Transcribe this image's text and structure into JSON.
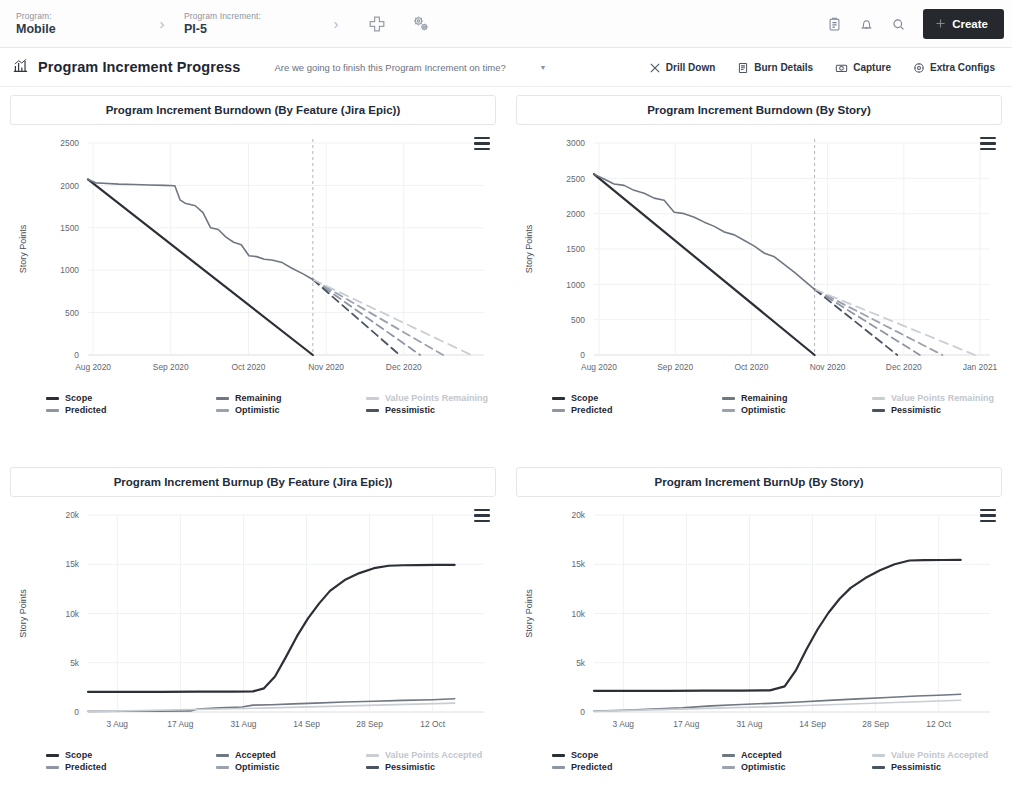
{
  "topbar": {
    "program_label": "Program:",
    "program_value": "Mobile",
    "increment_label": "Program Increment:",
    "increment_value": "PI-5",
    "separator": "›",
    "add_icon": "plus-icon",
    "settings_icon": "gears-icon",
    "clipboard_icon": "clipboard-icon",
    "bell_icon": "bell-icon",
    "search_icon": "search-icon",
    "create_label": "Create",
    "create_bg": "#25282c"
  },
  "subheader": {
    "title": "Program Increment Progress",
    "title_icon": "chart-icon",
    "question": "Are we going to finish this Program Increment on time?",
    "caret_icon": "chevron-down-icon",
    "actions": [
      {
        "label": "Drill Down",
        "icon": "drill-down-icon"
      },
      {
        "label": "Burn Details",
        "icon": "burn-details-icon"
      },
      {
        "label": "Capture",
        "icon": "capture-icon"
      },
      {
        "label": "Extra Configs",
        "icon": "extra-configs-icon"
      }
    ]
  },
  "colors": {
    "scope": "#2b2f36",
    "predicted": "#8f96a3",
    "remaining": "#6f7782",
    "optimistic": "#9aa2ad",
    "value_points": "#c9cdd4",
    "pessimistic": "#4a5360",
    "accepted": "#6f7782",
    "today_line": "#b7bcc5",
    "grid": "#f0f1f3"
  },
  "legends": {
    "burndown": [
      {
        "label": "Scope",
        "color": "#2b2f36"
      },
      {
        "label": "Remaining",
        "color": "#6f7782"
      },
      {
        "label": "Value Points Remaining",
        "color": "#c9cdd4"
      },
      {
        "label": "Predicted",
        "color": "#8f96a3"
      },
      {
        "label": "Optimistic",
        "color": "#9aa2ad"
      },
      {
        "label": "Pessimistic",
        "color": "#4a5360"
      }
    ],
    "burnup": [
      {
        "label": "Scope",
        "color": "#2b2f36"
      },
      {
        "label": "Accepted",
        "color": "#6f7782"
      },
      {
        "label": "Value Points Accepted",
        "color": "#c9cdd4"
      },
      {
        "label": "Predicted",
        "color": "#8f96a3"
      },
      {
        "label": "Optimistic",
        "color": "#9aa2ad"
      },
      {
        "label": "Pessimistic",
        "color": "#4a5360"
      }
    ]
  },
  "chart_data": [
    {
      "id": "burndown-feature",
      "type": "line",
      "title": "Program Increment Burndown (By Feature (Jira Epic))",
      "xlabel": "",
      "ylabel": "Story Points",
      "ylim": [
        0,
        2500
      ],
      "yticks": [
        0,
        500,
        1000,
        1500,
        2000,
        2500
      ],
      "ytick_labels": [
        "0",
        "500",
        "1000",
        "1500",
        "2000",
        "2500"
      ],
      "xticks": [
        "Aug 2020",
        "Sep 2020",
        "Oct 2020",
        "Nov 2020",
        "Dec 2020"
      ],
      "grid": true,
      "legend_position": "bottom",
      "today_marker": "Nov 2020",
      "series": [
        {
          "name": "Scope",
          "style": "solid",
          "x": [
            0,
            88
          ],
          "values": [
            2070,
            0
          ]
        },
        {
          "name": "Remaining",
          "style": "solid",
          "x": [
            0,
            3,
            6,
            12,
            18,
            24,
            30,
            34,
            36,
            38,
            42,
            45,
            48,
            51,
            54,
            57,
            60,
            63,
            66,
            69,
            72,
            76,
            80,
            84,
            88
          ],
          "values": [
            2070,
            2030,
            2025,
            2015,
            2010,
            2005,
            2000,
            1995,
            1830,
            1790,
            1760,
            1680,
            1500,
            1480,
            1390,
            1330,
            1300,
            1170,
            1160,
            1130,
            1120,
            1090,
            1020,
            960,
            890
          ]
        },
        {
          "name": "Predicted",
          "style": "dashed",
          "x": [
            88,
            130
          ],
          "values": [
            890,
            0
          ]
        },
        {
          "name": "Optimistic",
          "style": "dashed",
          "x": [
            88,
            139
          ],
          "values": [
            890,
            0
          ]
        },
        {
          "name": "Pessimistic",
          "style": "dashed",
          "x": [
            88,
            122
          ],
          "values": [
            890,
            0
          ]
        },
        {
          "name": "Value Points Remaining",
          "style": "dashed",
          "x": [
            88,
            150
          ],
          "values": [
            890,
            0
          ]
        }
      ]
    },
    {
      "id": "burndown-story",
      "type": "line",
      "title": "Program Increment Burndown (By Story)",
      "xlabel": "",
      "ylabel": "Story Points",
      "ylim": [
        0,
        3000
      ],
      "yticks": [
        0,
        500,
        1000,
        1500,
        2000,
        2500,
        3000
      ],
      "ytick_labels": [
        "0",
        "500",
        "1000",
        "1500",
        "2000",
        "2500",
        "3000"
      ],
      "xticks": [
        "Aug 2020",
        "Sep 2020",
        "Oct 2020",
        "Nov 2020",
        "Dec 2020",
        "Jan 2021"
      ],
      "grid": true,
      "legend_position": "bottom",
      "today_marker": "Nov 2020",
      "series": [
        {
          "name": "Scope",
          "style": "solid",
          "x": [
            0,
            88
          ],
          "values": [
            2560,
            0
          ]
        },
        {
          "name": "Remaining",
          "style": "solid",
          "x": [
            0,
            4,
            8,
            12,
            16,
            20,
            24,
            28,
            32,
            36,
            40,
            44,
            48,
            52,
            56,
            60,
            64,
            68,
            72,
            76,
            80,
            84,
            88
          ],
          "values": [
            2560,
            2490,
            2420,
            2400,
            2330,
            2290,
            2220,
            2190,
            2020,
            2000,
            1950,
            1880,
            1820,
            1740,
            1700,
            1620,
            1540,
            1440,
            1390,
            1280,
            1170,
            1050,
            930
          ]
        },
        {
          "name": "Predicted",
          "style": "dashed",
          "x": [
            88,
            130
          ],
          "values": [
            930,
            0
          ]
        },
        {
          "name": "Optimistic",
          "style": "dashed",
          "x": [
            88,
            139
          ],
          "values": [
            930,
            0
          ]
        },
        {
          "name": "Pessimistic",
          "style": "dashed",
          "x": [
            88,
            121
          ],
          "values": [
            930,
            0
          ]
        },
        {
          "name": "Value Points Remaining",
          "style": "dashed",
          "x": [
            88,
            152
          ],
          "values": [
            930,
            0
          ]
        }
      ]
    },
    {
      "id": "burnup-feature",
      "type": "line",
      "title": "Program Increment Burnup (By Feature (Jira Epic))",
      "xlabel": "",
      "ylabel": "Story Points",
      "ylim": [
        0,
        20000
      ],
      "yticks": [
        0,
        5000,
        10000,
        15000,
        20000
      ],
      "ytick_labels": [
        "0",
        "5k",
        "10k",
        "15k",
        "20k"
      ],
      "xticks": [
        "3 Aug",
        "17 Aug",
        "31 Aug",
        "14 Sep",
        "28 Sep",
        "12 Oct"
      ],
      "grid": true,
      "legend_position": "bottom",
      "series": [
        {
          "name": "Scope",
          "style": "solid",
          "x": [
            0,
            10,
            20,
            30,
            40,
            45,
            48,
            51,
            54,
            57,
            60,
            63,
            66,
            70,
            74,
            78,
            82,
            86,
            90,
            95,
            100
          ],
          "values": [
            2050,
            2050,
            2050,
            2060,
            2070,
            2100,
            2400,
            3600,
            5600,
            7700,
            9500,
            11000,
            12300,
            13400,
            14100,
            14600,
            14850,
            14900,
            14920,
            14930,
            14940
          ]
        },
        {
          "name": "Accepted",
          "style": "solid",
          "x": [
            0,
            10,
            20,
            28,
            30,
            36,
            42,
            45,
            50,
            56,
            62,
            70,
            78,
            86,
            94,
            100
          ],
          "values": [
            60,
            70,
            90,
            110,
            300,
            420,
            500,
            700,
            740,
            820,
            900,
            1010,
            1090,
            1180,
            1250,
            1340
          ]
        },
        {
          "name": "Value Points Accepted",
          "style": "solid",
          "x": [
            0,
            50,
            100
          ],
          "values": [
            40,
            420,
            900
          ]
        }
      ]
    },
    {
      "id": "burnup-story",
      "type": "line",
      "title": "Program Increment BurnUp (By Story)",
      "xlabel": "",
      "ylabel": "Story Points",
      "ylim": [
        0,
        20000
      ],
      "yticks": [
        0,
        5000,
        10000,
        15000,
        20000
      ],
      "ytick_labels": [
        "0",
        "5k",
        "10k",
        "15k",
        "20k"
      ],
      "xticks": [
        "3 Aug",
        "17 Aug",
        "31 Aug",
        "14 Sep",
        "28 Sep",
        "12 Oct"
      ],
      "grid": true,
      "legend_position": "bottom",
      "series": [
        {
          "name": "Scope",
          "style": "solid",
          "x": [
            0,
            10,
            20,
            30,
            40,
            48,
            52,
            55,
            58,
            61,
            64,
            67,
            70,
            74,
            78,
            82,
            86,
            90,
            95,
            100
          ],
          "values": [
            2150,
            2150,
            2150,
            2160,
            2170,
            2200,
            2600,
            4200,
            6400,
            8400,
            10100,
            11500,
            12600,
            13600,
            14400,
            15000,
            15380,
            15420,
            15430,
            15440
          ]
        },
        {
          "name": "Accepted",
          "style": "solid",
          "x": [
            0,
            8,
            16,
            24,
            32,
            40,
            48,
            56,
            64,
            72,
            80,
            88,
            94,
            100
          ],
          "values": [
            90,
            180,
            300,
            420,
            620,
            760,
            880,
            1010,
            1180,
            1330,
            1470,
            1620,
            1700,
            1800
          ]
        },
        {
          "name": "Value Points Accepted",
          "style": "solid",
          "x": [
            0,
            50,
            100
          ],
          "values": [
            60,
            560,
            1200
          ]
        }
      ]
    }
  ]
}
